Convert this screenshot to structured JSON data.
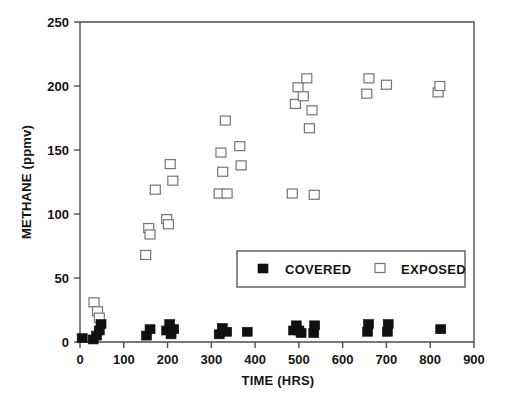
{
  "chart": {
    "type": "scatter",
    "title": "",
    "xlabel": "TIME (HRS)",
    "ylabel": "METHANE (ppmv)",
    "xlim": [
      0,
      900
    ],
    "ylim": [
      0,
      250
    ],
    "xticks": [
      0,
      100,
      200,
      300,
      400,
      500,
      600,
      700,
      800,
      900
    ],
    "yticks": [
      0,
      50,
      100,
      150,
      200,
      250
    ],
    "grid": false,
    "legend_position": "inside-center-right",
    "colors": {
      "covered_marker": "#101010",
      "exposed_marker_edge": "#757575",
      "exposed_marker_fill": "#ffffff",
      "axis": "#4d4d4d",
      "text": "#141414",
      "background": "#ffffff"
    },
    "legend": [
      {
        "label": "COVERED",
        "marker": "filled-square"
      },
      {
        "label": "EXPOSED",
        "marker": "open-square"
      }
    ],
    "series": [
      {
        "name": "COVERED",
        "marker": "filled-square",
        "points": [
          [
            5,
            3
          ],
          [
            30,
            2
          ],
          [
            38,
            5
          ],
          [
            44,
            9
          ],
          [
            48,
            14
          ],
          [
            152,
            5
          ],
          [
            160,
            10
          ],
          [
            198,
            9
          ],
          [
            205,
            14
          ],
          [
            208,
            6
          ],
          [
            214,
            10
          ],
          [
            318,
            6
          ],
          [
            325,
            11
          ],
          [
            335,
            8
          ],
          [
            382,
            8
          ],
          [
            488,
            9
          ],
          [
            494,
            13
          ],
          [
            500,
            9
          ],
          [
            505,
            7
          ],
          [
            534,
            7
          ],
          [
            536,
            13
          ],
          [
            657,
            8
          ],
          [
            659,
            14
          ],
          [
            702,
            8
          ],
          [
            704,
            14
          ],
          [
            824,
            10
          ]
        ]
      },
      {
        "name": "EXPOSED",
        "marker": "open-square",
        "points": [
          [
            32,
            31
          ],
          [
            40,
            24
          ],
          [
            44,
            19
          ],
          [
            150,
            68
          ],
          [
            157,
            89
          ],
          [
            160,
            84
          ],
          [
            172,
            119
          ],
          [
            198,
            96
          ],
          [
            202,
            92
          ],
          [
            206,
            139
          ],
          [
            212,
            126
          ],
          [
            318,
            116
          ],
          [
            322,
            148
          ],
          [
            326,
            133
          ],
          [
            332,
            173
          ],
          [
            336,
            116
          ],
          [
            365,
            153
          ],
          [
            368,
            138
          ],
          [
            485,
            116
          ],
          [
            492,
            186
          ],
          [
            498,
            199
          ],
          [
            510,
            192
          ],
          [
            518,
            206
          ],
          [
            524,
            167
          ],
          [
            530,
            181
          ],
          [
            535,
            115
          ],
          [
            655,
            194
          ],
          [
            660,
            206
          ],
          [
            700,
            201
          ],
          [
            818,
            195
          ],
          [
            822,
            200
          ]
        ]
      }
    ]
  }
}
